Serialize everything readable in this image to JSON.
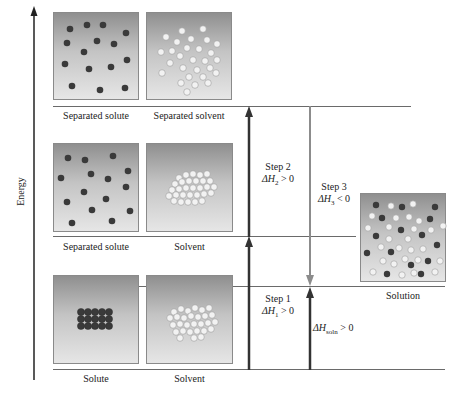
{
  "axis": {
    "label": "Energy"
  },
  "levels": {
    "top": {
      "boxes": [
        {
          "label": "Separated solute",
          "content": "separated-solute-particles"
        },
        {
          "label": "Separated solvent",
          "content": "separated-solvent-particles"
        }
      ]
    },
    "middle": {
      "boxes": [
        {
          "label": "Separated solute",
          "content": "separated-solute-particles"
        },
        {
          "label": "Solvent",
          "content": "clustered-solvent-particles"
        }
      ]
    },
    "bottom": {
      "boxes": [
        {
          "label": "Solute",
          "content": "solute-lattice"
        },
        {
          "label": "Solvent",
          "content": "clustered-solvent-particles"
        }
      ]
    },
    "solution": {
      "label": "Solution",
      "content": "mixed-solution-particles"
    }
  },
  "steps": {
    "step1": {
      "title": "Step 1",
      "delta": "ΔH",
      "sub": "1",
      "relation": " > 0"
    },
    "step2": {
      "title": "Step 2",
      "delta": "ΔH",
      "sub": "2",
      "relation": " > 0"
    },
    "step3": {
      "title": "Step 3",
      "delta": "ΔH",
      "sub": "3",
      "relation": " < 0"
    },
    "soln": {
      "delta": "ΔH",
      "sub": "soln",
      "relation": " > 0"
    }
  },
  "colors": {
    "solute_particle": "#3a3a3a",
    "solvent_particle": "#f2f2f2",
    "arrow_dark": "#333333",
    "arrow_gray": "#8c8c8c",
    "level_line": "#6a6a6a"
  }
}
